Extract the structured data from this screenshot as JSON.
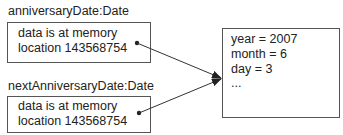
{
  "references": [
    {
      "label": "anniversaryDate:Date",
      "lines": [
        "data is at memory",
        "location 143568754"
      ]
    },
    {
      "label": "nextAnniversaryDate:Date",
      "lines": [
        "data is at memory",
        "location 143568754"
      ]
    }
  ],
  "object": {
    "fields": [
      "year = 2007",
      "month = 6",
      "day = 3",
      "..."
    ]
  },
  "colors": {
    "line": "#333333",
    "border": "#555555",
    "text": "#222222"
  }
}
